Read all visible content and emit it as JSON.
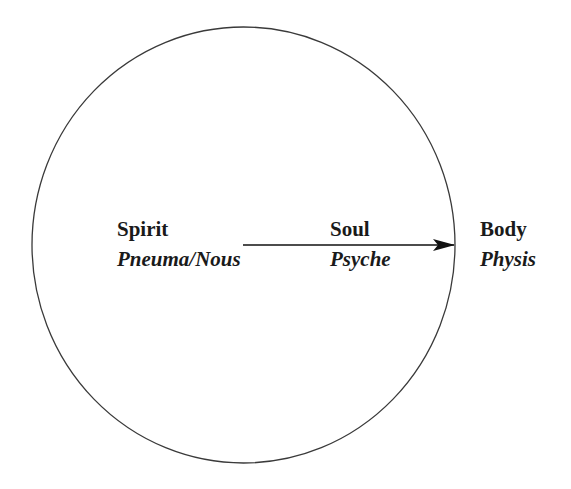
{
  "diagram": {
    "type": "concentric-anthropology",
    "shape": "circle",
    "stroke_color": "#3a3a3a",
    "text_color": "#1a1a1a",
    "background": "#ffffff",
    "nodes": [
      {
        "id": "spirit",
        "label": "Spirit",
        "sublabel": "Pneuma/Nous",
        "position": "center"
      },
      {
        "id": "soul",
        "label": "Soul",
        "sublabel": "Psyche",
        "position": "between-center-and-edge"
      },
      {
        "id": "body",
        "label": "Body",
        "sublabel": "Physis",
        "position": "outside-circle-edge"
      }
    ],
    "arrow": {
      "from": "spirit",
      "to": "body",
      "direction": "right",
      "from_point": "circle-center",
      "to_point": "circle-edge"
    }
  }
}
